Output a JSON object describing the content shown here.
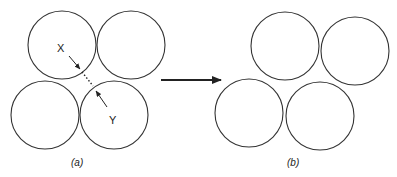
{
  "diagram": {
    "panel_a": {
      "caption": "(a)",
      "circles": [
        {
          "cx": 62,
          "cy": 45,
          "r": 34
        },
        {
          "cx": 131,
          "cy": 45,
          "r": 34
        },
        {
          "cx": 45,
          "cy": 115,
          "r": 34
        },
        {
          "cx": 114,
          "cy": 115,
          "r": 34
        }
      ],
      "labels": {
        "x_point": "X",
        "y_point": "Y"
      }
    },
    "panel_b": {
      "caption": "(b)",
      "circles": [
        {
          "cx": 285,
          "cy": 46,
          "r": 34
        },
        {
          "cx": 355,
          "cy": 51,
          "r": 34
        },
        {
          "cx": 249,
          "cy": 113,
          "r": 34
        },
        {
          "cx": 320,
          "cy": 116,
          "r": 34
        }
      ]
    },
    "transition_arrow": {
      "from": "panel_a",
      "to": "panel_b"
    },
    "colors": {
      "stroke": "#333333",
      "background": "#ffffff"
    }
  }
}
